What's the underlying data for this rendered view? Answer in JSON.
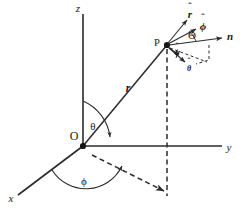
{
  "figure": {
    "background_color": "#ffffff",
    "ink_color": "#2b2b2b",
    "width": 247,
    "height": 212
  },
  "axes": [
    {
      "id": "z",
      "label": "z",
      "description": "vertical axis pointing up"
    },
    {
      "id": "y",
      "label": "y",
      "description": "horizontal axis pointing right"
    },
    {
      "id": "x",
      "label": "x",
      "description": "oblique axis pointing down-left toward viewer"
    }
  ],
  "points": [
    {
      "id": "origin",
      "label": "O",
      "description": "coordinate origin"
    },
    {
      "id": "p",
      "label": "P",
      "description": "field point in space"
    }
  ],
  "vectors": [
    {
      "id": "r-vector",
      "label": "r",
      "style": "bold-italic",
      "description": "position vector from origin to P"
    },
    {
      "id": "n-vector",
      "label": "n",
      "style": "bold",
      "description": "surface normal direction at P"
    },
    {
      "id": "r-hat",
      "label": "r",
      "accent": "circumflex",
      "style": "bold-italic-hat",
      "description": "radial unit vector"
    },
    {
      "id": "phi-hat",
      "label": "ϕ",
      "accent": "circumflex",
      "style": "bold-hat",
      "description": "azimuthal unit vector"
    },
    {
      "id": "theta-hat",
      "label": "θ",
      "accent": "circumflex",
      "style": "bold-hat",
      "description": "polar unit vector"
    },
    {
      "id": "phi-hat-small",
      "label": "ϕ",
      "accent": "circumflex",
      "style": "bold-hat-small",
      "description": "second small azimuthal unit vector marker"
    }
  ],
  "angles": [
    {
      "id": "theta-polar",
      "label": "θ",
      "description": "polar angle between z axis and position vector r"
    },
    {
      "id": "phi-azimuth",
      "label": "ϕ",
      "description": "azimuthal angle in the xy plane measured from x axis"
    },
    {
      "id": "theta-capital",
      "label": "Θ",
      "description": "angle between n and phi-hat at point P"
    },
    {
      "id": "phi-small-at-p",
      "label": "ϕ",
      "description": "small angle marked near theta-hat at point P"
    }
  ],
  "construction_lines": [
    {
      "id": "p-drop",
      "style": "dashed",
      "description": "vertical dashed line dropped from P to the xy plane"
    },
    {
      "id": "origin-projection",
      "style": "dashed",
      "description": "dashed line from origin to the foot of the perpendicular in the xy plane"
    },
    {
      "id": "normal-arc",
      "style": "dashed",
      "description": "small dashed arc/bracket near n and theta-hat at P"
    }
  ]
}
